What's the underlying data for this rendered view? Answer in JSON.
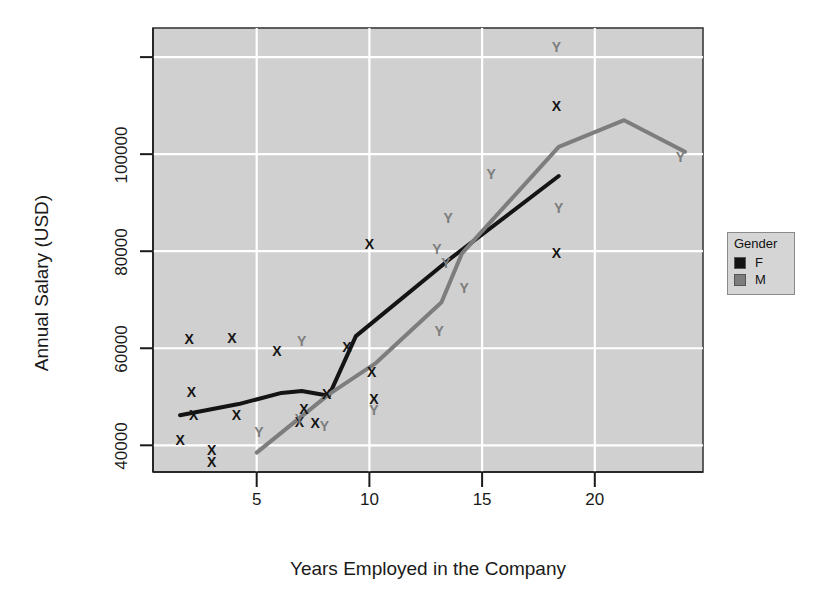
{
  "chart_data": {
    "type": "scatter",
    "title": "",
    "xlabel": "Years Employed in the Company",
    "ylabel": "Annual Salary (USD)",
    "xlim": [
      0.4,
      24.8
    ],
    "ylim": [
      34500,
      126000
    ],
    "xticks": [
      5,
      10,
      15,
      20
    ],
    "xtick_labels": [
      "5",
      "10",
      "15",
      "20"
    ],
    "yticks": [
      40000,
      60000,
      80000,
      100000,
      120000
    ],
    "ytick_labels": [
      "40000",
      "60000",
      "80000",
      "100000",
      ""
    ],
    "grid": true,
    "grid_color": "#ffffff",
    "panel_background": "#d0d0d0",
    "legend": {
      "title": "Gender",
      "position": "right",
      "entries": [
        {
          "label": "F",
          "color": "#141414",
          "marker": "X"
        },
        {
          "label": "M",
          "color": "#7d7d7d",
          "marker": "Y"
        }
      ]
    },
    "series": [
      {
        "name": "F",
        "marker": "X",
        "color": "#141414",
        "points": [
          {
            "x": 1.6,
            "y": 41000
          },
          {
            "x": 2.0,
            "y": 62000
          },
          {
            "x": 2.1,
            "y": 51000
          },
          {
            "x": 2.2,
            "y": 46200
          },
          {
            "x": 3.0,
            "y": 39000
          },
          {
            "x": 3.0,
            "y": 36500
          },
          {
            "x": 3.9,
            "y": 62200
          },
          {
            "x": 4.1,
            "y": 46300
          },
          {
            "x": 5.9,
            "y": 59500
          },
          {
            "x": 6.9,
            "y": 44800
          },
          {
            "x": 7.1,
            "y": 47500
          },
          {
            "x": 7.6,
            "y": 44600
          },
          {
            "x": 8.1,
            "y": 50500
          },
          {
            "x": 9.0,
            "y": 60300
          },
          {
            "x": 10.0,
            "y": 81500
          },
          {
            "x": 10.1,
            "y": 55200
          },
          {
            "x": 10.2,
            "y": 49500
          },
          {
            "x": 18.3,
            "y": 110000
          },
          {
            "x": 18.3,
            "y": 79700
          }
        ]
      },
      {
        "name": "M",
        "marker": "Y",
        "color": "#7d7d7d",
        "points": [
          {
            "x": 5.1,
            "y": 42800
          },
          {
            "x": 6.9,
            "y": 45500
          },
          {
            "x": 7.0,
            "y": 61500
          },
          {
            "x": 8.0,
            "y": 44000
          },
          {
            "x": 10.2,
            "y": 47200
          },
          {
            "x": 13.0,
            "y": 80500
          },
          {
            "x": 13.1,
            "y": 63500
          },
          {
            "x": 13.4,
            "y": 77500
          },
          {
            "x": 13.5,
            "y": 86800
          },
          {
            "x": 14.2,
            "y": 72500
          },
          {
            "x": 15.4,
            "y": 96000
          },
          {
            "x": 18.3,
            "y": 122000
          },
          {
            "x": 18.4,
            "y": 89000
          },
          {
            "x": 23.8,
            "y": 99500
          }
        ]
      }
    ],
    "lines": [
      {
        "name": "F",
        "color": "#141414",
        "width": 4,
        "points": [
          {
            "x": 1.6,
            "y": 46200
          },
          {
            "x": 4.2,
            "y": 48500
          },
          {
            "x": 6.1,
            "y": 50800
          },
          {
            "x": 7.0,
            "y": 51200
          },
          {
            "x": 8.2,
            "y": 50200
          },
          {
            "x": 9.4,
            "y": 62500
          },
          {
            "x": 13.6,
            "y": 78500
          },
          {
            "x": 18.4,
            "y": 95500
          }
        ]
      },
      {
        "name": "M",
        "color": "#7d7d7d",
        "width": 4,
        "points": [
          {
            "x": 5.0,
            "y": 38500
          },
          {
            "x": 8.2,
            "y": 50500
          },
          {
            "x": 10.3,
            "y": 57000
          },
          {
            "x": 13.2,
            "y": 69500
          },
          {
            "x": 14.1,
            "y": 79500
          },
          {
            "x": 18.4,
            "y": 101500
          },
          {
            "x": 21.3,
            "y": 107000
          },
          {
            "x": 24.0,
            "y": 100500
          }
        ]
      }
    ]
  }
}
